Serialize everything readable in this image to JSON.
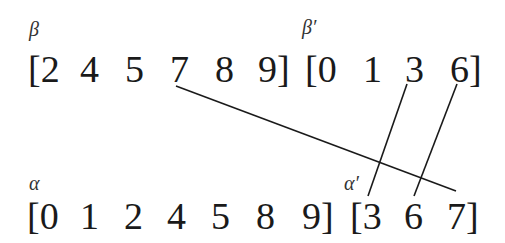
{
  "top": {
    "beta_label": "β",
    "beta_prime_label": "β′",
    "beta": [
      "[2",
      "4",
      "5",
      "7",
      "8",
      "9]"
    ],
    "beta_prime": [
      "[0",
      "1",
      "3",
      "6]"
    ]
  },
  "bottom": {
    "alpha_label": "α",
    "alpha_prime_label": "α′",
    "alpha": [
      "[0",
      "1",
      "2",
      "4",
      "5",
      "8",
      "9]"
    ],
    "alpha_prime": [
      "[3",
      "6",
      "7]"
    ]
  },
  "links": [
    {
      "from": "β:7",
      "to": "α′:7"
    },
    {
      "from": "β′:3",
      "to": "α′:3"
    },
    {
      "from": "β′:6",
      "to": "α′:6"
    }
  ]
}
